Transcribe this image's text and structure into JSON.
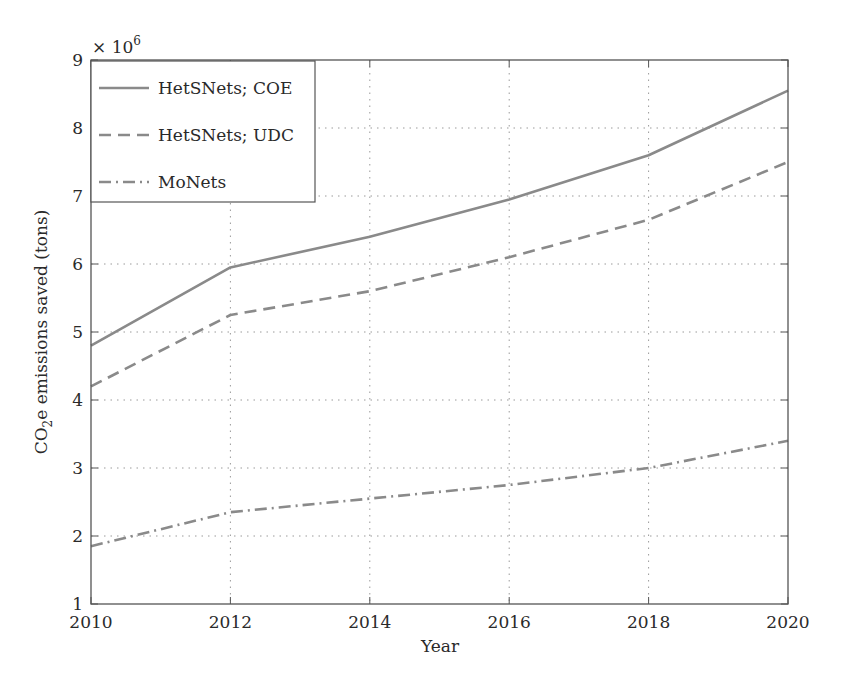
{
  "chart_data": {
    "type": "line",
    "title": "",
    "xlabel": "Year",
    "ylabel": "CO2e emissions saved (tons)",
    "ylabel_parts": {
      "pre": "CO",
      "sub": "2",
      "post": "e emissions saved (tons)"
    },
    "y_multiplier": "× 10",
    "y_multiplier_exp": "6",
    "x": [
      2010,
      2012,
      2014,
      2016,
      2018,
      2020
    ],
    "xlim": [
      2010,
      2020
    ],
    "ylim": [
      1,
      9
    ],
    "xticks": [
      "2010",
      "2012",
      "2014",
      "2016",
      "2018",
      "2020"
    ],
    "yticks": [
      "1",
      "2",
      "3",
      "4",
      "5",
      "6",
      "7",
      "8",
      "9"
    ],
    "grid": true,
    "legend_position": "upper left",
    "series": [
      {
        "name": "HetSNets; COE",
        "style": "solid",
        "color": "#8a8a8a",
        "values": [
          4.8,
          5.95,
          6.4,
          6.95,
          7.6,
          8.55
        ]
      },
      {
        "name": "HetSNets; UDC",
        "style": "dashed",
        "color": "#8a8a8a",
        "values": [
          4.2,
          5.25,
          5.6,
          6.1,
          6.65,
          7.5
        ]
      },
      {
        "name": "MoNets",
        "style": "dashdot",
        "color": "#8a8a8a",
        "values": [
          1.85,
          2.35,
          2.55,
          2.75,
          3.0,
          3.4
        ]
      }
    ]
  }
}
